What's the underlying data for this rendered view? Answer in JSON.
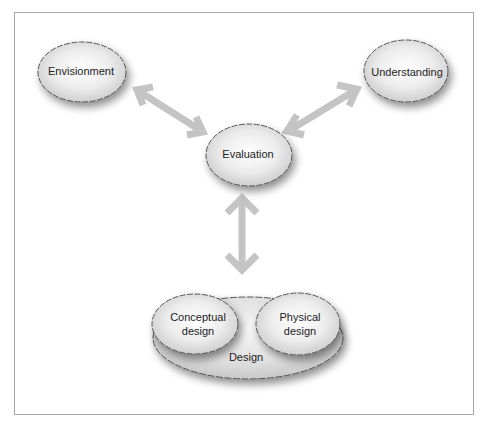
{
  "diagram": {
    "nodes": [
      {
        "id": "envisionment",
        "label": "Envisionment",
        "cx": 75,
        "cy": 71
      },
      {
        "id": "understanding",
        "label": "Understanding",
        "cx": 409,
        "cy": 71
      },
      {
        "id": "evaluation",
        "label": "Evaluation",
        "cx": 249,
        "cy": 155
      },
      {
        "id": "design",
        "label": "Design",
        "cx": 243,
        "cy": 356
      },
      {
        "id": "conceptual-design",
        "label_line1": "Conceptual",
        "label_line2": "design",
        "cx": 200,
        "cy": 325
      },
      {
        "id": "physical-design",
        "label_line1": "Physical",
        "label_line2": "design",
        "cx": 298,
        "cy": 325
      }
    ],
    "edges": [
      {
        "from": "envisionment",
        "to": "evaluation",
        "type": "bidirectional"
      },
      {
        "from": "understanding",
        "to": "evaluation",
        "type": "bidirectional"
      },
      {
        "from": "evaluation",
        "to": "design",
        "type": "bidirectional"
      }
    ],
    "colors": {
      "arrow": "#c4c4c4",
      "node_fill_center": "#ffffff",
      "node_fill_edge": "#cfcfcf",
      "node_stroke": "#555555",
      "frame": "#a8a8a8"
    }
  }
}
